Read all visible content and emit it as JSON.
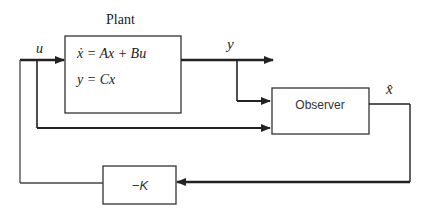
{
  "diagram": {
    "plant": {
      "title": "Plant",
      "equation_state": "ẋ = Ax + Bu",
      "equation_output": "y = Cx"
    },
    "observer": {
      "label": "Observer"
    },
    "gain": {
      "label": "−K"
    },
    "signals": {
      "input": "u",
      "output": "y",
      "estimate": "x̂"
    },
    "colors": {
      "line": "#222222",
      "box_border": "#333333",
      "background": "#ffffff"
    }
  }
}
